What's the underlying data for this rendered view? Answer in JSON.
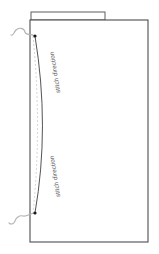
{
  "figure": {
    "type": "technical-line-drawing",
    "background_color": "#ffffff",
    "outline_color": "#4d4d4f",
    "curve_color": "#3f3f41",
    "guide_color": "#c9c9c9",
    "thread_color": "#b3b3b3",
    "marker_color": "#1a1a1a",
    "label_color": "#58585a"
  },
  "panel": {
    "name": "fabric-panel",
    "x": 30,
    "y": 20,
    "width": 118,
    "height": 222
  },
  "top_strip": {
    "name": "panel-top-strip",
    "x": 31,
    "y": 12,
    "width": 74,
    "height": 8
  },
  "stitch_curve": {
    "name": "stitch-curve",
    "start": [
      35,
      36
    ],
    "control": [
      50,
      127
    ],
    "end": [
      35,
      213
    ],
    "stroke_width": 0.9
  },
  "guide_line": {
    "name": "guide-dashed-line",
    "start": [
      33,
      36
    ],
    "control": [
      42,
      127
    ],
    "end": [
      33,
      213
    ],
    "dash": "2 2"
  },
  "markers": [
    {
      "name": "stitch-start-marker",
      "cx": 35,
      "cy": 36,
      "r": 1.6
    },
    {
      "name": "stitch-end-marker",
      "cx": 35,
      "cy": 213,
      "r": 1.6
    }
  ],
  "threads": [
    {
      "name": "thread-loop-top",
      "path": "M35,36 C30,33 26,36 25,32 C24,28 19,27 16,30 C13,33 14,36 11,35"
    },
    {
      "name": "thread-loop-bottom",
      "path": "M35,213 C30,213 27,217 23,216 C19,215 16,218 15,221 C14,224 11,225 9,223"
    }
  ],
  "labels": [
    {
      "name": "stitch-direction-label-upper",
      "text": "stitch direction",
      "x": 57,
      "y": 72,
      "rotation": 261
    },
    {
      "name": "stitch-direction-label-lower",
      "text": "stitch direction",
      "x": 57,
      "y": 176,
      "rotation": 261
    }
  ]
}
